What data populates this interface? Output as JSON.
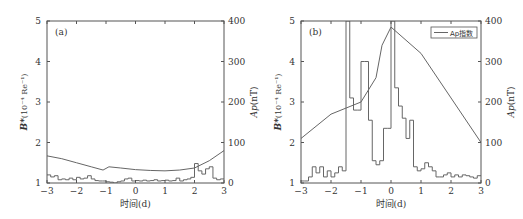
{
  "chart_data": [
    {
      "type": "line",
      "panel_label": "(a)",
      "xlabel": "时间(d)",
      "ylabel_left": "B*(10⁻⁴ Re⁻¹)",
      "ylabel_right": "Ap(nT)",
      "xlim": [
        -3,
        3
      ],
      "ylim_left": [
        1,
        5
      ],
      "ylim_right": [
        0,
        400
      ],
      "x_ticks": [
        "-3",
        "-2",
        "-1",
        "0",
        "1",
        "2",
        "3"
      ],
      "y_ticks_left": [
        "1",
        "2",
        "3",
        "4",
        "5"
      ],
      "y_ticks_right": [
        "0",
        "100",
        "200",
        "300",
        "400"
      ],
      "grid": false,
      "series": [
        {
          "name": "B*",
          "kind": "line",
          "axis": "left",
          "x": [
            -3,
            -2.5,
            -2,
            -1.5,
            -1.1,
            -0.9,
            -0.5,
            0,
            0.5,
            1,
            1.5,
            2,
            2.5,
            3
          ],
          "y": [
            1.67,
            1.6,
            1.5,
            1.4,
            1.32,
            1.4,
            1.37,
            1.33,
            1.31,
            1.3,
            1.32,
            1.37,
            1.55,
            1.8
          ]
        },
        {
          "name": "Ap指数",
          "kind": "step",
          "axis": "right",
          "x": [
            -3,
            -2.875,
            -2.75,
            -2.625,
            -2.5,
            -2.375,
            -2.25,
            -2.125,
            -2,
            -1.875,
            -1.75,
            -1.625,
            -1.5,
            -1.375,
            -1.25,
            -1.125,
            -1,
            -0.875,
            -0.75,
            -0.625,
            -0.5,
            -0.375,
            -0.25,
            -0.125,
            0,
            0.125,
            0.25,
            0.375,
            0.5,
            0.625,
            0.75,
            0.875,
            1,
            1.125,
            1.25,
            1.375,
            1.5,
            1.625,
            1.75,
            1.875,
            2,
            2.125,
            2.25,
            2.375,
            2.5,
            2.625,
            2.75,
            2.875
          ],
          "y": [
            20,
            15,
            18,
            8,
            10,
            8,
            12,
            8,
            14,
            10,
            12,
            18,
            10,
            6,
            5,
            5,
            3,
            2,
            0,
            3,
            5,
            10,
            12,
            5,
            6,
            5,
            7,
            5,
            6,
            8,
            5,
            6,
            7,
            5,
            6,
            12,
            5,
            8,
            10,
            14,
            48,
            30,
            22,
            35,
            40,
            12,
            8,
            10
          ]
        }
      ]
    },
    {
      "type": "line",
      "panel_label": "(b)",
      "legend": [
        "Ap指数"
      ],
      "legend_position": "upper right",
      "xlabel": "时间(d)",
      "ylabel_left": "B*(10⁻⁴ Re⁻¹)",
      "ylabel_right": "Ap(nT)",
      "xlim": [
        -3,
        3
      ],
      "ylim_left": [
        1,
        5
      ],
      "ylim_right": [
        0,
        400
      ],
      "x_ticks": [
        "-3",
        "-2",
        "-1",
        "0",
        "1",
        "2",
        "3"
      ],
      "y_ticks_left": [
        "1",
        "2",
        "3",
        "4",
        "5"
      ],
      "y_ticks_right": [
        "0",
        "100",
        "200",
        "300",
        "400"
      ],
      "grid": false,
      "series": [
        {
          "name": "B*",
          "kind": "step",
          "axis": "left",
          "x": [
            -3,
            -2.875,
            -2.75,
            -2.625,
            -2.5,
            -2.375,
            -2.25,
            -2.125,
            -2,
            -1.875,
            -1.75,
            -1.625,
            -1.5,
            -1.375,
            -1.25,
            -1.125,
            -1,
            -0.875,
            -0.75,
            -0.625,
            -0.5,
            -0.375,
            -0.25,
            -0.125,
            0,
            0.125,
            0.25,
            0.375,
            0.5,
            0.625,
            0.75,
            0.875,
            1,
            1.125,
            1.25,
            1.375,
            1.5,
            1.625,
            1.75,
            1.875,
            2,
            2.125,
            2.25,
            2.375,
            2.5,
            2.625,
            2.75,
            2.875
          ],
          "y": [
            1.05,
            1.05,
            1.15,
            1.4,
            1.25,
            1.4,
            1.15,
            1.3,
            1.15,
            1.25,
            1.4,
            1.3,
            5.0,
            3.1,
            2.8,
            2.8,
            4.0,
            4.0,
            2.55,
            1.55,
            1.45,
            1.55,
            2.35,
            2.35,
            5.0,
            3.35,
            2.9,
            2.6,
            2.1,
            2.55,
            1.4,
            1.3,
            1.35,
            1.5,
            1.4,
            1.3,
            1.15,
            1.15,
            1.2,
            1.25,
            1.15,
            1.2,
            1.15,
            1.2,
            1.18,
            1.15,
            1.12,
            1.18
          ]
        },
        {
          "name": "Ap指数",
          "kind": "line",
          "axis": "right",
          "x": [
            -3,
            -2,
            -1,
            -0.5,
            -0.3,
            0,
            1,
            2,
            3
          ],
          "y": [
            110,
            170,
            200,
            260,
            340,
            385,
            320,
            210,
            100
          ]
        }
      ]
    }
  ],
  "labels": {
    "panel_a": "(a)",
    "panel_b": "(b)",
    "xlabel": "时间(d)",
    "ylabel_left_prefix": "B*",
    "ylabel_left_units": "(10⁻⁴ Re⁻¹)",
    "ylabel_right": "Ap(nT)",
    "legend_label": "Ap指数"
  },
  "colors": {
    "axis": "#555555",
    "line": "#666666",
    "text": "#333333"
  }
}
